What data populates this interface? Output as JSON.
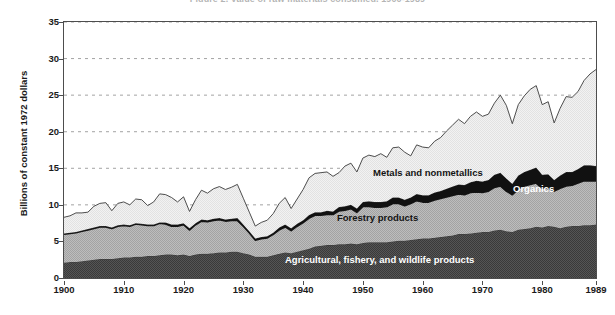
{
  "title": "Figure 2. Value of raw materials consumed, 1900-1989",
  "axes": {
    "ylabel": "Billions of constant 1972 dollars",
    "yticks": [
      0,
      5,
      10,
      15,
      20,
      25,
      30,
      35
    ],
    "xticks": [
      "1900",
      "1910",
      "1920",
      "1930",
      "1940",
      "1950",
      "1960",
      "1970",
      "1980",
      "1989"
    ]
  },
  "annotations": [
    {
      "name": "metals-and-nonmetallics",
      "label": "Metals and nonmetallics",
      "color": "#141414"
    },
    {
      "name": "organics",
      "label": "Organics",
      "color": "#ffffff"
    },
    {
      "name": "forestry-products",
      "label": "Forestry products",
      "color": "#141414"
    },
    {
      "name": "agricultural-products",
      "label": "Agricultural, fishery, and wildlife products",
      "color": "#ffffff"
    }
  ],
  "colors": {
    "agricultural": "#4d4d4d",
    "forestry": "#b4b4b4",
    "organics": "#111111",
    "metals": "#ededed",
    "outline": "#3a3a3a",
    "frame": "#4d4d4d",
    "grid": "#8c8c8c"
  },
  "chart_data": {
    "type": "area",
    "stacked": true,
    "title": "Figure 2. Value of raw materials consumed, 1900-1989",
    "xlabel": "",
    "ylabel": "Billions of constant 1972 dollars",
    "xlim": [
      1900,
      1989
    ],
    "ylim": [
      0,
      35
    ],
    "grid": true,
    "grid_axis": "y",
    "legend": "in-plot area annotations",
    "x": [
      1900,
      1901,
      1902,
      1903,
      1904,
      1905,
      1906,
      1907,
      1908,
      1909,
      1910,
      1911,
      1912,
      1913,
      1914,
      1915,
      1916,
      1917,
      1918,
      1919,
      1920,
      1921,
      1922,
      1923,
      1924,
      1925,
      1926,
      1927,
      1928,
      1929,
      1930,
      1931,
      1932,
      1933,
      1934,
      1935,
      1936,
      1937,
      1938,
      1939,
      1940,
      1941,
      1942,
      1943,
      1944,
      1945,
      1946,
      1947,
      1948,
      1949,
      1950,
      1951,
      1952,
      1953,
      1954,
      1955,
      1956,
      1957,
      1958,
      1959,
      1960,
      1961,
      1962,
      1963,
      1964,
      1965,
      1966,
      1967,
      1968,
      1969,
      1970,
      1971,
      1972,
      1973,
      1974,
      1975,
      1976,
      1977,
      1978,
      1979,
      1980,
      1981,
      1982,
      1983,
      1984,
      1985,
      1986,
      1987,
      1988,
      1989
    ],
    "series": [
      {
        "name": "Agricultural, fishery, and wildlife products",
        "color": "#4d4d4d",
        "values": [
          2.1,
          2.2,
          2.2,
          2.3,
          2.4,
          2.5,
          2.6,
          2.6,
          2.6,
          2.7,
          2.8,
          2.8,
          2.9,
          2.9,
          3.0,
          3.0,
          3.1,
          3.2,
          3.2,
          3.1,
          3.2,
          3.0,
          3.2,
          3.3,
          3.3,
          3.4,
          3.5,
          3.5,
          3.6,
          3.6,
          3.4,
          3.2,
          2.9,
          2.9,
          2.9,
          3.1,
          3.3,
          3.5,
          3.4,
          3.6,
          3.8,
          4.0,
          4.3,
          4.4,
          4.5,
          4.5,
          4.6,
          4.6,
          4.7,
          4.6,
          4.8,
          4.9,
          4.9,
          4.9,
          4.9,
          5.0,
          5.1,
          5.1,
          5.2,
          5.3,
          5.4,
          5.4,
          5.5,
          5.6,
          5.7,
          5.8,
          6.0,
          6.0,
          6.1,
          6.2,
          6.3,
          6.3,
          6.5,
          6.6,
          6.4,
          6.3,
          6.6,
          6.7,
          6.8,
          7.0,
          6.9,
          7.1,
          7.0,
          6.8,
          7.0,
          7.1,
          7.1,
          7.2,
          7.2,
          7.3
        ]
      },
      {
        "name": "Forestry products",
        "color": "#b4b4b4",
        "values": [
          3.9,
          3.9,
          4.0,
          4.1,
          4.2,
          4.3,
          4.4,
          4.4,
          4.2,
          4.4,
          4.4,
          4.3,
          4.5,
          4.4,
          4.2,
          4.2,
          4.4,
          4.2,
          3.9,
          4.0,
          4.1,
          3.6,
          4.1,
          4.5,
          4.4,
          4.5,
          4.5,
          4.3,
          4.3,
          4.3,
          3.7,
          3.0,
          2.3,
          2.5,
          2.6,
          2.9,
          3.3,
          3.5,
          3.1,
          3.5,
          3.8,
          4.2,
          4.3,
          4.2,
          4.2,
          4.2,
          4.6,
          4.7,
          4.8,
          4.4,
          5.0,
          4.9,
          4.8,
          4.8,
          4.9,
          5.2,
          5.1,
          4.8,
          5.0,
          5.3,
          5.0,
          5.0,
          5.2,
          5.3,
          5.4,
          5.5,
          5.5,
          5.4,
          5.6,
          5.6,
          5.4,
          5.6,
          5.9,
          6.0,
          5.5,
          5.1,
          5.6,
          5.9,
          6.0,
          6.0,
          5.4,
          5.3,
          4.9,
          5.5,
          5.6,
          5.6,
          5.9,
          6.1,
          6.1,
          6.0
        ]
      },
      {
        "name": "Organics",
        "color": "#111111",
        "values": [
          0.1,
          0.1,
          0.1,
          0.1,
          0.1,
          0.1,
          0.1,
          0.1,
          0.1,
          0.1,
          0.1,
          0.1,
          0.1,
          0.1,
          0.1,
          0.1,
          0.1,
          0.2,
          0.2,
          0.2,
          0.2,
          0.2,
          0.2,
          0.2,
          0.2,
          0.2,
          0.2,
          0.2,
          0.2,
          0.3,
          0.2,
          0.2,
          0.2,
          0.2,
          0.2,
          0.2,
          0.3,
          0.3,
          0.3,
          0.3,
          0.3,
          0.4,
          0.4,
          0.4,
          0.5,
          0.4,
          0.5,
          0.5,
          0.5,
          0.5,
          0.6,
          0.7,
          0.7,
          0.7,
          0.7,
          0.8,
          0.8,
          0.8,
          0.8,
          0.9,
          0.9,
          0.9,
          1.0,
          1.0,
          1.1,
          1.2,
          1.3,
          1.3,
          1.4,
          1.5,
          1.5,
          1.5,
          1.7,
          1.8,
          1.7,
          1.5,
          1.8,
          1.9,
          2.0,
          2.1,
          1.8,
          1.8,
          1.5,
          1.7,
          1.9,
          1.8,
          1.9,
          2.1,
          2.1,
          2.0
        ]
      },
      {
        "name": "Metals and nonmetallics",
        "color": "#ededed",
        "values": [
          2.2,
          2.3,
          2.6,
          2.4,
          2.3,
          2.9,
          3.1,
          3.2,
          2.3,
          3.0,
          3.1,
          2.8,
          3.3,
          3.3,
          2.6,
          3.1,
          3.9,
          3.8,
          3.7,
          3.1,
          3.6,
          2.3,
          3.2,
          4.0,
          3.7,
          4.1,
          4.3,
          4.1,
          4.3,
          4.6,
          3.6,
          2.6,
          1.7,
          2.0,
          2.2,
          2.6,
          3.3,
          3.7,
          2.7,
          3.4,
          4.2,
          5.1,
          5.3,
          5.4,
          5.3,
          4.8,
          4.7,
          5.5,
          5.7,
          5.0,
          6.0,
          6.3,
          6.2,
          6.6,
          6.0,
          6.8,
          6.9,
          6.5,
          5.7,
          6.7,
          6.6,
          6.5,
          7.0,
          7.3,
          7.9,
          8.4,
          8.9,
          8.4,
          9.0,
          9.4,
          8.9,
          9.0,
          9.8,
          10.6,
          10.0,
          8.2,
          9.7,
          10.4,
          11.0,
          11.2,
          9.6,
          9.9,
          7.8,
          9.2,
          10.3,
          10.2,
          10.6,
          11.6,
          12.5,
          13.2
        ]
      }
    ],
    "totals": [
      8.3,
      8.5,
      8.9,
      8.9,
      9.0,
      9.8,
      10.2,
      10.3,
      9.2,
      10.2,
      10.4,
      10.0,
      10.8,
      10.7,
      9.9,
      10.4,
      11.5,
      11.4,
      11.0,
      10.4,
      11.1,
      9.1,
      10.7,
      12.0,
      11.6,
      12.2,
      12.5,
      12.1,
      12.4,
      12.8,
      10.9,
      9.0,
      7.1,
      7.6,
      7.9,
      8.8,
      10.2,
      11.0,
      9.5,
      10.8,
      12.1,
      13.7,
      14.3,
      14.4,
      14.5,
      13.9,
      14.4,
      15.3,
      15.7,
      14.5,
      16.4,
      16.8,
      16.6,
      17.0,
      16.5,
      17.8,
      17.9,
      17.2,
      16.7,
      18.2,
      17.9,
      17.8,
      18.7,
      19.2,
      20.1,
      20.9,
      21.7,
      21.1,
      22.1,
      22.7,
      22.1,
      22.4,
      23.9,
      25.0,
      23.6,
      21.1,
      23.7,
      24.9,
      25.8,
      26.3,
      23.7,
      24.1,
      21.2,
      23.2,
      24.8,
      24.7,
      25.5,
      27.0,
      27.9,
      28.5
    ]
  }
}
